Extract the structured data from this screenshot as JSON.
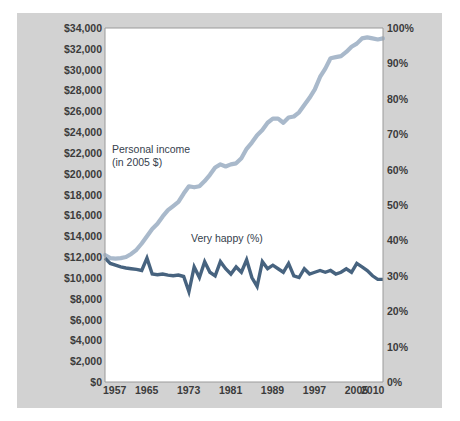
{
  "figure": {
    "title": "",
    "background_color": "#d2d2d2",
    "plot_background_color": "#ffffff"
  },
  "annotations": {
    "income_label": "Personal income\n(in 2005 $)",
    "happy_label": "Very happy (%)"
  },
  "axes": {
    "y_left_ticks": [
      "$34,000",
      "$32,000",
      "$30,000",
      "$28,000",
      "$26,000",
      "$24,000",
      "$22,000",
      "$20,000",
      "$18,000",
      "$16,000",
      "$14,000",
      "$12,000",
      "$10,000",
      "$8,000",
      "$6,000",
      "$4,000",
      "$2,000",
      "$0"
    ],
    "y_right_ticks": [
      "100%",
      "90%",
      "80%",
      "70%",
      "60%",
      "50%",
      "40%",
      "30%",
      "20%",
      "10%",
      "0%"
    ],
    "x_ticks": [
      "1957",
      "1965",
      "1973",
      "1981",
      "1989",
      "1997",
      "2005",
      "2010"
    ]
  },
  "colors": {
    "income_line": "#a9b9cb",
    "happy_line": "#47637f",
    "panel": "#d2d2d2",
    "plot": "#ffffff",
    "text": "#3b3b3b"
  },
  "chart_data": {
    "type": "line",
    "title": "",
    "xlabel": "",
    "ylabel": "",
    "xlim": [
      1957,
      2010
    ],
    "grid": false,
    "legend": "inline-annotations",
    "y_axes": [
      {
        "name": "Personal income (in 2005 $)",
        "side": "left",
        "ylim": [
          0,
          34000
        ],
        "tick_step": 2000,
        "tick_labels": [
          "$0",
          "$2,000",
          "$4,000",
          "$6,000",
          "$8,000",
          "$10,000",
          "$12,000",
          "$14,000",
          "$16,000",
          "$18,000",
          "$20,000",
          "$22,000",
          "$24,000",
          "$26,000",
          "$28,000",
          "$30,000",
          "$32,000",
          "$34,000"
        ]
      },
      {
        "name": "Very happy (%)",
        "side": "right",
        "ylim": [
          0,
          100
        ],
        "tick_step": 10,
        "tick_labels": [
          "0%",
          "10%",
          "20%",
          "30%",
          "40%",
          "50%",
          "60%",
          "70%",
          "80%",
          "90%",
          "100%"
        ]
      }
    ],
    "x": [
      1957,
      1958,
      1959,
      1960,
      1961,
      1962,
      1963,
      1964,
      1965,
      1966,
      1967,
      1968,
      1969,
      1970,
      1971,
      1972,
      1973,
      1974,
      1975,
      1976,
      1977,
      1978,
      1979,
      1980,
      1981,
      1982,
      1983,
      1984,
      1985,
      1986,
      1987,
      1988,
      1989,
      1990,
      1991,
      1992,
      1993,
      1994,
      1995,
      1996,
      1997,
      1998,
      1999,
      2000,
      2001,
      2002,
      2003,
      2004,
      2005,
      2006,
      2007,
      2008,
      2009,
      2010
    ],
    "series": [
      {
        "name": "Personal income (in 2005 $)",
        "axis": "left",
        "color": "#a9b9cb",
        "unit": "2005 dollars",
        "values": [
          12200,
          11900,
          11850,
          11900,
          12000,
          12300,
          12700,
          13300,
          14000,
          14700,
          15200,
          15900,
          16500,
          16900,
          17300,
          18100,
          18800,
          18700,
          18800,
          19300,
          19900,
          20600,
          20900,
          20700,
          20900,
          21000,
          21500,
          22400,
          23000,
          23700,
          24200,
          24900,
          25300,
          25300,
          24900,
          25400,
          25500,
          25900,
          26600,
          27300,
          28100,
          29300,
          30100,
          31100,
          31200,
          31300,
          31700,
          32200,
          32500,
          33000,
          33100,
          33000,
          32900,
          33000
        ]
      },
      {
        "name": "Very happy (%)",
        "axis": "right",
        "color": "#47637f",
        "unit": "percent",
        "values": [
          35.0,
          33.5,
          33.0,
          32.5,
          32.2,
          32.0,
          31.8,
          31.5,
          35.0,
          30.5,
          30.3,
          30.5,
          30.2,
          30.0,
          30.2,
          29.8,
          25.5,
          32.5,
          29.5,
          34.0,
          31.0,
          30.0,
          34.0,
          32.0,
          30.5,
          32.5,
          31.0,
          34.5,
          29.5,
          27.0,
          34.0,
          32.0,
          33.0,
          32.0,
          31.0,
          33.5,
          30.0,
          29.5,
          32.0,
          30.5,
          31.0,
          31.5,
          31.0,
          31.5,
          30.5,
          31.0,
          32.0,
          31.0,
          33.5,
          32.5,
          31.5,
          30.0,
          29.0,
          29.0
        ]
      }
    ]
  }
}
